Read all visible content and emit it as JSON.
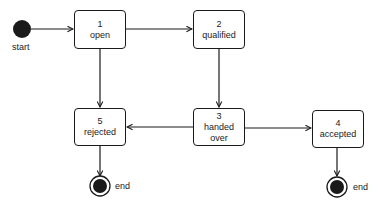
{
  "diagram": {
    "type": "state-machine",
    "start": {
      "label": "start"
    },
    "states": [
      {
        "id": "1",
        "number": "1",
        "name": "open"
      },
      {
        "id": "2",
        "number": "2",
        "name": "qualified"
      },
      {
        "id": "3",
        "number": "3",
        "name_line1": "handed",
        "name_line2": "over"
      },
      {
        "id": "4",
        "number": "4",
        "name": "accepted"
      },
      {
        "id": "5",
        "number": "5",
        "name": "rejected"
      }
    ],
    "ends": [
      {
        "attached_to": "5",
        "label": "end"
      },
      {
        "attached_to": "4",
        "label": "end"
      }
    ],
    "transitions": [
      {
        "from": "start",
        "to": "1"
      },
      {
        "from": "1",
        "to": "2"
      },
      {
        "from": "1",
        "to": "5"
      },
      {
        "from": "2",
        "to": "3"
      },
      {
        "from": "3",
        "to": "5"
      },
      {
        "from": "3",
        "to": "4"
      },
      {
        "from": "5",
        "to": "end"
      },
      {
        "from": "4",
        "to": "end"
      }
    ],
    "colors": {
      "stroke": "#1a1a1a",
      "fill": "#ffffff",
      "node_fill": "#1a1a1a"
    }
  }
}
